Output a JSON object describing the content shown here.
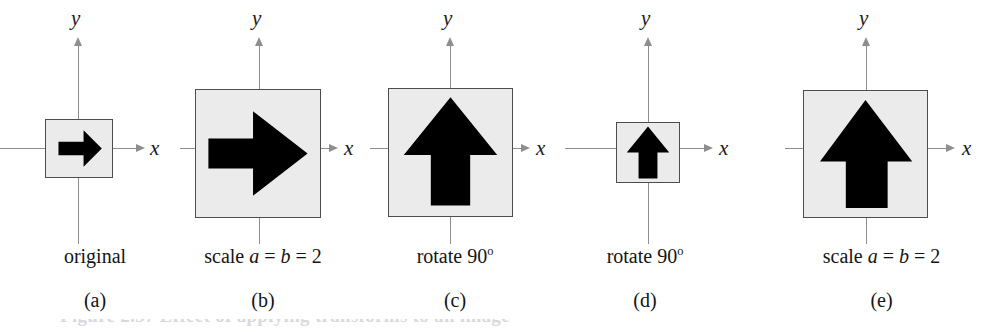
{
  "figure": {
    "background_color": "#ffffff",
    "square_fill_color": "#ebebeb",
    "square_border_color": "#4d4d4d",
    "arrow_color": "#000000",
    "axis_color": "#8e8e8e",
    "text_color": "#141414",
    "axis_label_y": "y",
    "axis_label_x": "x",
    "caption_strip_text": "Figure 2.37  Effect of applying transforms to an image"
  },
  "panels": [
    {
      "id": "a",
      "sublabel": "(a)",
      "caption_prefix": "original",
      "caption_italic_a": "",
      "caption_mid": "",
      "caption_italic_b": "",
      "caption_suffix": "",
      "caption_plain": "original",
      "arrow_direction": "right",
      "arrow_name": "arrow-right",
      "box_size_px": 68,
      "scale": 1
    },
    {
      "id": "b",
      "sublabel": "(b)",
      "caption_prefix": "scale ",
      "caption_italic_a": "a",
      "caption_mid": " = ",
      "caption_italic_b": "b",
      "caption_suffix": " = 2",
      "caption_plain": "scale a = b = 2",
      "arrow_direction": "right",
      "arrow_name": "arrow-right",
      "box_size_px": 128,
      "scale": 2
    },
    {
      "id": "c",
      "sublabel": "(c)",
      "caption_prefix": "rotate 90",
      "caption_italic_a": "",
      "caption_mid": "",
      "caption_italic_b": "",
      "caption_suffix": "o",
      "caption_plain": "rotate 90o",
      "arrow_direction": "up",
      "arrow_name": "arrow-up",
      "box_size_px": 128,
      "scale": 2
    },
    {
      "id": "d",
      "sublabel": "(d)",
      "caption_prefix": "rotate 90",
      "caption_italic_a": "",
      "caption_mid": "",
      "caption_italic_b": "",
      "caption_suffix": "o",
      "caption_plain": "rotate 90o",
      "arrow_direction": "up",
      "arrow_name": "arrow-up",
      "box_size_px": 64,
      "scale": 1
    },
    {
      "id": "e",
      "sublabel": "(e)",
      "caption_prefix": "scale ",
      "caption_italic_a": "a",
      "caption_mid": " = ",
      "caption_italic_b": "b",
      "caption_suffix": " = 2",
      "caption_plain": "scale a = b = 2",
      "arrow_direction": "up",
      "arrow_name": "arrow-up",
      "box_size_px": 126,
      "scale": 2
    }
  ]
}
